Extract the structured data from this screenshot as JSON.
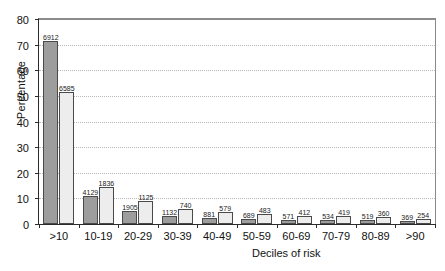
{
  "chart_data": {
    "type": "bar",
    "title": "",
    "xlabel": "Deciles of risk",
    "ylabel": "Percentage",
    "ylim": [
      0,
      80
    ],
    "yticks": [
      "0",
      "10",
      "20",
      "30",
      "40",
      "50",
      "60",
      "70",
      "80"
    ],
    "grid": true,
    "legend": "none",
    "categories": [
      ">10",
      "10-19",
      "20-29",
      "30-39",
      "40-49",
      "50-59",
      "60-69",
      "70-79",
      "80-89",
      ">90"
    ],
    "series": [
      {
        "name": "dark",
        "color": "#9d9d9d",
        "values": [
          71.5,
          10.8,
          5.0,
          3.0,
          2.3,
          1.8,
          1.5,
          1.4,
          1.4,
          1.0
        ],
        "labels": [
          "6912",
          "4129",
          "1905",
          "1132",
          "881",
          "689",
          "571",
          "534",
          "519",
          "369"
        ]
      },
      {
        "name": "light",
        "color": "#ededed",
        "values": [
          51.5,
          14.3,
          8.8,
          5.8,
          4.5,
          3.8,
          3.2,
          3.3,
          2.8,
          2.0
        ],
        "labels": [
          "6585",
          "1836",
          "1125",
          "740",
          "579",
          "483",
          "412",
          "419",
          "360",
          "254"
        ]
      }
    ]
  }
}
